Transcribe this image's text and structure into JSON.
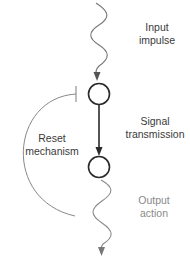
{
  "diagram": {
    "labels": {
      "input": [
        "Input",
        "impulse"
      ],
      "signal": [
        "Signal",
        "transmission"
      ],
      "reset": [
        "Reset",
        "mechanism"
      ],
      "output": [
        "Output",
        "action"
      ]
    },
    "nodes": [
      {
        "id": "upper-node",
        "cx": 99,
        "cy": 94,
        "r": 11
      },
      {
        "id": "lower-node",
        "cx": 99,
        "cy": 167,
        "r": 11
      }
    ],
    "edges": [
      {
        "from": "input",
        "to": "upper-node",
        "style": "wavy-arrow"
      },
      {
        "from": "upper-node",
        "to": "lower-node",
        "style": "straight-arrow"
      },
      {
        "from": "lower-node",
        "to": "upper-node",
        "style": "inhibitory-arc",
        "label": "Reset mechanism"
      },
      {
        "from": "lower-node",
        "to": "output",
        "style": "wavy-arrow"
      }
    ],
    "colors": {
      "node_stroke": "#2a2a2a",
      "main_arrow": "#2a2a2a",
      "wavy_line": "#777777",
      "reset_arc": "#888888",
      "label_dark": "#3a3a3a",
      "label_light": "#8a8a8a"
    }
  }
}
